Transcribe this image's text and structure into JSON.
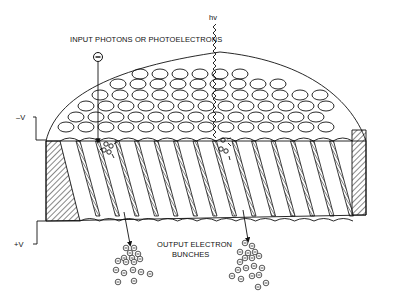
{
  "diagram": {
    "labels": {
      "input": "INPUT PHOTONS OR PHOTOELECTRONS",
      "photon": "hv",
      "neg_voltage": "–V",
      "pos_voltage": "+V",
      "output_line1": "OUTPUT ELECTRON",
      "output_line2": "BUNCHES"
    },
    "symbols": {
      "electron": "⊖",
      "input_electron": "electron-icon",
      "photon_wave": "wavy-arrow"
    },
    "colors": {
      "ink": "#111111",
      "background": "#ffffff"
    }
  }
}
